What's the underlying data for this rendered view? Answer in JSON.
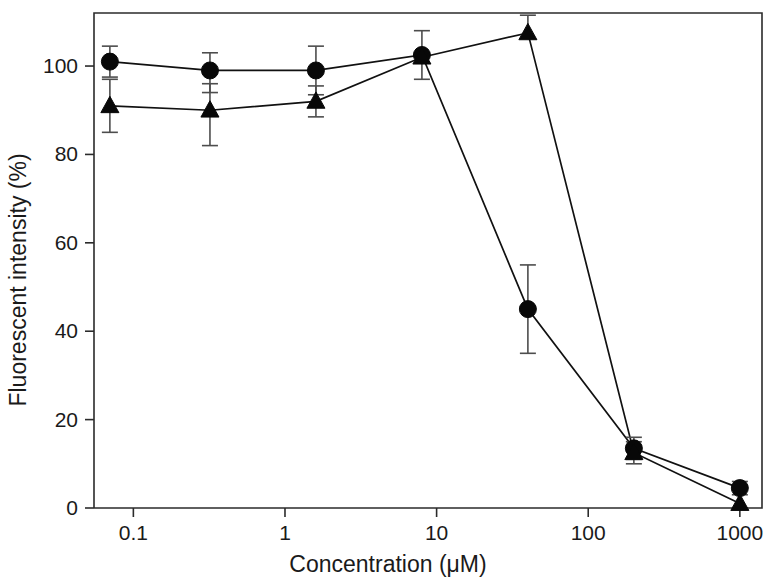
{
  "chart_data": {
    "type": "line",
    "title": "",
    "xlabel": "Concentration (μM)",
    "ylabel": "Fluorescent intensity (%)",
    "xscale": "log",
    "xlim": [
      0.055,
      1400
    ],
    "ylim": [
      0,
      112
    ],
    "grid": false,
    "legend": "none",
    "x_tick_labels": [
      "0.1",
      "1",
      "10",
      "100",
      "1000"
    ],
    "x_tick_values": [
      0.1,
      1,
      10,
      100,
      1000
    ],
    "y_tick_labels": [
      "0",
      "20",
      "40",
      "60",
      "80",
      "100"
    ],
    "y_tick_values": [
      0,
      20,
      40,
      60,
      80,
      100
    ],
    "x": [
      0.07,
      0.32,
      1.6,
      8,
      40,
      200,
      1000
    ],
    "series": [
      {
        "name": "circle-series",
        "marker": "filled-circle",
        "values": [
          101,
          99,
          99,
          102.5,
          45,
          13.5,
          4.5
        ],
        "err_low": [
          3.5,
          5,
          5.5,
          5.5,
          10,
          2.5,
          1.5
        ],
        "err_high": [
          3.5,
          4,
          5.5,
          5.5,
          10,
          2.5,
          1.5
        ]
      },
      {
        "name": "triangle-series",
        "marker": "filled-triangle",
        "values": [
          91,
          90,
          92,
          102,
          107.5,
          12.5,
          1
        ],
        "err_low": [
          6,
          8,
          3.5,
          0,
          0,
          2.5,
          0
        ],
        "err_high": [
          6,
          6,
          3.5,
          0,
          4,
          2.5,
          0
        ]
      }
    ]
  },
  "colors": {
    "marker": "#080808",
    "line": "#111111",
    "axis": "#2b2b2b",
    "errorbar": "#4d4d4d",
    "text": "#1a1a1a",
    "background": "#ffffff"
  }
}
